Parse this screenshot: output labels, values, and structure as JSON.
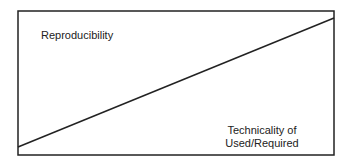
{
  "diagram": {
    "labels": {
      "top_left": "Reproducibility",
      "bottom_right_line1": "Technicality of",
      "bottom_right_line2": "Used/Required"
    },
    "frame": {
      "x": 18,
      "y": 11,
      "width": 316,
      "height": 144
    },
    "trend_line": {
      "x1": 18,
      "y1": 147,
      "x2": 334,
      "y2": 18
    },
    "colors": {
      "stroke": "#222222",
      "background": "#ffffff"
    }
  }
}
